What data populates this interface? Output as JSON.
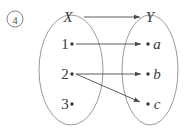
{
  "figure": {
    "marker": "4",
    "marker_icon": "circled-number-icon",
    "background_color": "#ffffff",
    "line_color": "#4a4a4a",
    "ellipse_color": "#8d8d8d",
    "text_color": "#3a3a3a"
  },
  "sets": {
    "domain": {
      "label": "X",
      "elements": [
        {
          "label": "1",
          "cx": 72,
          "cy": 44
        },
        {
          "label": "2",
          "cx": 72,
          "cy": 74
        },
        {
          "label": "3",
          "cx": 72,
          "cy": 104
        }
      ],
      "ellipse": {
        "cx": 71,
        "cy": 70,
        "rx": 32,
        "ry": 55
      },
      "label_pos": {
        "x": 68,
        "y": 22
      }
    },
    "codomain": {
      "label": "Y",
      "elements": [
        {
          "label": "a",
          "cx": 148,
          "cy": 44
        },
        {
          "label": "b",
          "cx": 148,
          "cy": 74
        },
        {
          "label": "c",
          "cx": 148,
          "cy": 104
        }
      ],
      "ellipse": {
        "cx": 150,
        "cy": 70,
        "rx": 28,
        "ry": 55
      },
      "label_pos": {
        "x": 147,
        "y": 22
      }
    }
  },
  "arrows": [
    {
      "name": "arrow-X-to-Y",
      "from": "X",
      "to": "Y",
      "x1": 84,
      "y1": 17,
      "x2": 140,
      "y2": 17
    },
    {
      "name": "arrow-1-to-a",
      "from": "1",
      "to": "a",
      "x1": 75,
      "y1": 44,
      "x2": 141,
      "y2": 44
    },
    {
      "name": "arrow-2-to-b",
      "from": "2",
      "to": "b",
      "x1": 75,
      "y1": 74,
      "x2": 141,
      "y2": 74
    },
    {
      "name": "arrow-2-to-c",
      "from": "2",
      "to": "c",
      "x1": 75,
      "y1": 74,
      "x2": 140,
      "y2": 102
    }
  ]
}
